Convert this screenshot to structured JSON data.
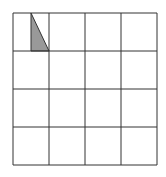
{
  "diagram": {
    "type": "grid-with-shaded-triangle",
    "grid": {
      "rows": 4,
      "cols": 4,
      "x": 13,
      "y": 13,
      "width": 144,
      "height": 152,
      "line_color": "#333333"
    },
    "shaded_triangle": {
      "cell": {
        "row": 0,
        "col": 0
      },
      "points": "31,13 31,51 49,51",
      "fill": "#999999",
      "stroke": "#333333"
    }
  }
}
